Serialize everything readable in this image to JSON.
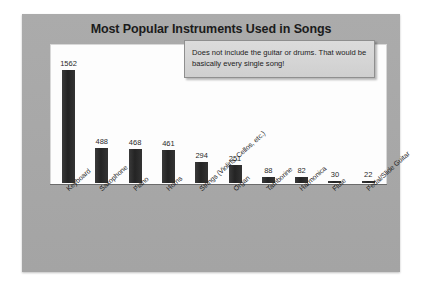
{
  "slide": {
    "title": "Most Popular Instruments Used in Songs",
    "callout": "Does not include the guitar or drums.  That would be basically every single song!"
  },
  "chart_data": {
    "type": "bar",
    "title": "Most Popular Instruments Used in Songs",
    "xlabel": "",
    "ylabel": "",
    "ylim": [
      0,
      1562
    ],
    "grid": false,
    "legend": "none",
    "categories": [
      "Keyboard",
      "Saxophone",
      "Piano",
      "Horns",
      "Strings (Violins, Cellos, etc.)",
      "Organ",
      "Tamborine",
      "Harmonica",
      "Flute",
      "Pedal/Slide Guitar"
    ],
    "values": [
      1562,
      488,
      468,
      461,
      294,
      251,
      88,
      82,
      30,
      22
    ],
    "annotations": [
      "Does not include the guitar or drums.  That would be basically every single song!"
    ],
    "colors": {
      "bar": "#2b2b2b",
      "plot_background": "#fdfdfd",
      "slide_background": "#a8a8a8",
      "title_text": "#1b1b1b",
      "callout_background": "#d6d6d6"
    }
  }
}
